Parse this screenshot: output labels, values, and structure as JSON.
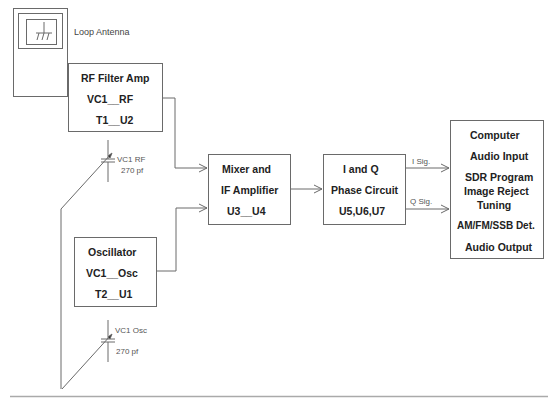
{
  "diagram": {
    "antenna": {
      "label": "Loop Antenna"
    },
    "blocks": {
      "rf_amp": {
        "lines": [
          "RF Filter Amp",
          "VC1__RF",
          "T1__U2"
        ]
      },
      "oscillator": {
        "lines": [
          "Oscillator",
          "VC1__Osc",
          "T2__U1"
        ]
      },
      "mixer": {
        "lines": [
          "Mixer and",
          "IF Amplifier",
          "U3__U4"
        ]
      },
      "iq": {
        "lines": [
          "I and Q",
          "Phase Circuit",
          "U5,U6,U7"
        ]
      },
      "computer": {
        "lines": [
          "Computer",
          "Audio Input",
          "SDR Program",
          "Image Reject",
          "Tuning",
          "AM/FM/SSB Det.",
          "Audio Output"
        ]
      }
    },
    "capacitors": {
      "vc1_rf": {
        "name": "VC1 RF",
        "value": "270 pf"
      },
      "vc1_osc": {
        "name": "VC1 Osc",
        "value": "270 pf"
      }
    },
    "signals": {
      "i": "I Sig.",
      "q": "Q Sig."
    },
    "colors": {
      "line": "#6a6a6a",
      "text": "#222222",
      "background": "#ffffff"
    }
  }
}
